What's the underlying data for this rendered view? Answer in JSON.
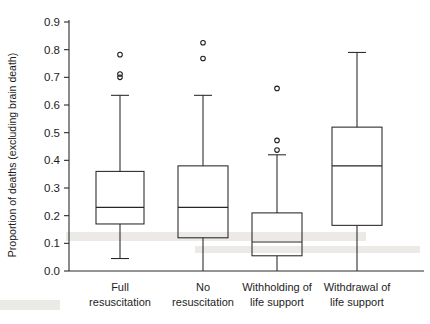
{
  "chart_data": {
    "type": "box",
    "title": "",
    "xlabel": "",
    "ylabel": "Proportion of deaths (excluding brain death)",
    "ylim": [
      0.0,
      0.9
    ],
    "yticks": [
      "0.0",
      "0.1",
      "0.2",
      "0.3",
      "0.4",
      "0.5",
      "0.6",
      "0.7",
      "0.8",
      "0.9"
    ],
    "ytick_values": [
      0.0,
      0.1,
      0.2,
      0.3,
      0.4,
      0.5,
      0.6,
      0.7,
      0.8,
      0.9
    ],
    "grid": false,
    "legend": "none",
    "categories": [
      "Full resuscitation",
      "No resuscitation",
      "Withholding of life support",
      "Withdrawal of life support"
    ],
    "category_lines": [
      [
        "Full",
        "resuscitation"
      ],
      [
        "No",
        "resuscitation"
      ],
      [
        "Withholding of",
        "life support"
      ],
      [
        "Withdrawal of",
        "life support"
      ]
    ],
    "boxes": [
      {
        "name": "Full resuscitation",
        "whisker_low": 0.045,
        "q1": 0.17,
        "median": 0.23,
        "q3": 0.36,
        "whisker_high": 0.635,
        "outliers": [
          0.7,
          0.712,
          0.782
        ]
      },
      {
        "name": "No resuscitation",
        "whisker_low": 0.0,
        "q1": 0.12,
        "median": 0.23,
        "q3": 0.38,
        "whisker_high": 0.635,
        "outliers": [
          0.768,
          0.825
        ]
      },
      {
        "name": "Withholding of life support",
        "whisker_low": 0.0,
        "q1": 0.055,
        "median": 0.105,
        "q3": 0.21,
        "whisker_high": 0.42,
        "outliers": [
          0.437,
          0.472,
          0.66
        ]
      },
      {
        "name": "Withdrawal of life support",
        "whisker_low": 0.0,
        "q1": 0.165,
        "median": 0.38,
        "q3": 0.52,
        "whisker_high": 0.79,
        "outliers": []
      }
    ],
    "colors": {
      "stroke": "#262626",
      "background": "#ffffff",
      "text": "#1d1d1d"
    }
  }
}
